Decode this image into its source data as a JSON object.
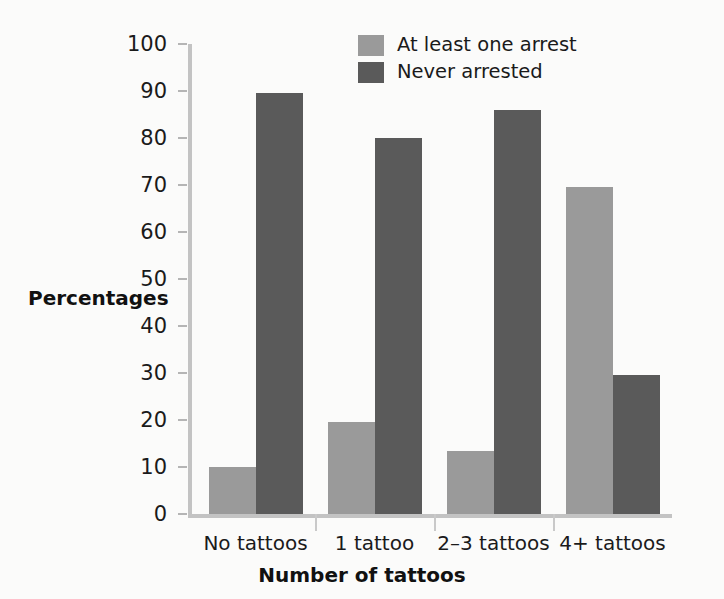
{
  "chart_data": {
    "type": "bar",
    "title": "",
    "xlabel": "Number of tattoos",
    "ylabel": "Percentages",
    "categories": [
      "No tattoos",
      "1 tattoo",
      "2–3 tattoos",
      "4+ tattoos"
    ],
    "series": [
      {
        "name": "At least one arrest",
        "color": "#9a9a9a",
        "values": [
          10,
          19.5,
          13.5,
          69.5
        ]
      },
      {
        "name": "Never arrested",
        "color": "#5a5a5a",
        "values": [
          89.5,
          80,
          86,
          29.5
        ]
      }
    ],
    "ylim": [
      0,
      100
    ],
    "ytick_labels": [
      "0",
      "10",
      "20",
      "30",
      "40",
      "50",
      "60",
      "70",
      "80",
      "90",
      "100"
    ],
    "ytick_values": [
      0,
      10,
      20,
      30,
      40,
      50,
      60,
      70,
      80,
      90,
      100
    ],
    "grid": false,
    "legend_position": "top-center",
    "background_color": "#fbfbfa",
    "axis_color": "#c3c3c3"
  }
}
